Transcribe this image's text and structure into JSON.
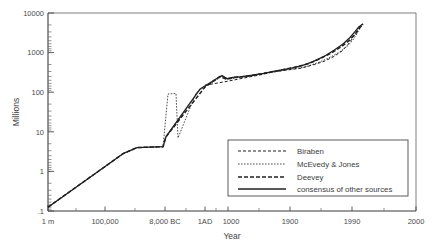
{
  "chart_data": {
    "type": "line",
    "title": "",
    "subtitle": "",
    "xlabel": "Year",
    "ylabel": "Millions",
    "yscale": "log",
    "ylim": [
      0.1,
      10000
    ],
    "grid": false,
    "legend_position": "bottom-right",
    "y_tick_labels": [
      "10000",
      "1000",
      "100",
      "10",
      "1",
      ".1"
    ],
    "y_tick_values": [
      10000,
      1000,
      100,
      10,
      1,
      0.1
    ],
    "x_tick_labels": [
      "1 m",
      "100,000",
      "8,000 BC",
      "1AD",
      "1000",
      "1900",
      "1990",
      "2000"
    ],
    "x_axis_note": "non-linear compressed time axis: 1 million years ago to 2000 AD",
    "series": [
      {
        "name": "Biraben",
        "style": "fine-dashed",
        "points": [
          [
            205,
            150
          ],
          [
            228,
            190
          ],
          [
            252,
            250
          ],
          [
            262,
            280
          ],
          [
            272,
            320
          ],
          [
            286,
            360
          ],
          [
            300,
            400
          ],
          [
            312,
            480
          ],
          [
            324,
            600
          ],
          [
            334,
            800
          ],
          [
            342,
            1100
          ],
          [
            348,
            1600
          ],
          [
            352,
            2200
          ],
          [
            356,
            3200
          ],
          [
            359,
            4400
          ],
          [
            362,
            5300
          ]
        ]
      },
      {
        "name": "McEvedy & Jones",
        "style": "dotted",
        "points": [
          [
            48,
            0.125
          ],
          [
            123,
            2.8
          ],
          [
            137,
            4.0
          ],
          [
            163,
            4.2
          ],
          [
            168,
            90
          ],
          [
            176,
            93
          ],
          [
            178,
            7.0
          ],
          [
            196,
            95
          ],
          [
            205,
            140
          ],
          [
            216,
            200
          ],
          [
            222,
            255
          ],
          [
            228,
            210
          ],
          [
            236,
            230
          ],
          [
            248,
            250
          ],
          [
            262,
            290
          ],
          [
            275,
            330
          ],
          [
            290,
            380
          ],
          [
            305,
            430
          ],
          [
            318,
            560
          ],
          [
            330,
            760
          ],
          [
            340,
            1050
          ],
          [
            348,
            1500
          ],
          [
            353,
            2100
          ],
          [
            357,
            3000
          ],
          [
            360,
            4200
          ],
          [
            363,
            5300
          ]
        ]
      },
      {
        "name": "Deevey",
        "style": "thick-dashed",
        "points": [
          [
            48,
            0.125
          ],
          [
            123,
            2.8
          ],
          [
            137,
            4.0
          ],
          [
            163,
            4.2
          ],
          [
            166,
            7.5
          ],
          [
            205,
            135
          ],
          [
            214,
            195
          ],
          [
            220,
            250
          ],
          [
            226,
            215
          ],
          [
            234,
            235
          ],
          [
            248,
            255
          ],
          [
            262,
            295
          ],
          [
            278,
            350
          ],
          [
            294,
            420
          ],
          [
            308,
            520
          ],
          [
            320,
            700
          ],
          [
            332,
            1000
          ],
          [
            342,
            1450
          ],
          [
            350,
            2100
          ],
          [
            356,
            3100
          ],
          [
            360,
            4300
          ],
          [
            363,
            5300
          ]
        ]
      },
      {
        "name": "consensus of other sources",
        "style": "solid",
        "points": [
          [
            48,
            0.125
          ],
          [
            123,
            2.8
          ],
          [
            137,
            4.0
          ],
          [
            163,
            4.2
          ],
          [
            166,
            7.5
          ],
          [
            200,
            120
          ],
          [
            208,
            160
          ],
          [
            216,
            215
          ],
          [
            222,
            262
          ],
          [
            227,
            220
          ],
          [
            233,
            238
          ],
          [
            242,
            248
          ],
          [
            252,
            268
          ],
          [
            264,
            300
          ],
          [
            276,
            345
          ],
          [
            290,
            400
          ],
          [
            302,
            470
          ],
          [
            313,
            590
          ],
          [
            324,
            800
          ],
          [
            334,
            1150
          ],
          [
            343,
            1650
          ],
          [
            350,
            2400
          ],
          [
            355,
            3400
          ],
          [
            359,
            4500
          ],
          [
            363,
            5300
          ]
        ]
      }
    ],
    "legend_entries": [
      {
        "label": "Biraben",
        "style": "fine-dashed"
      },
      {
        "label": "McEvedy & Jones",
        "style": "dotted"
      },
      {
        "label": "Deevey",
        "style": "thick-dashed"
      },
      {
        "label": "consensus of other sources",
        "style": "solid"
      }
    ]
  },
  "axes": {
    "y_title": "Millions",
    "x_title": "Year",
    "y_ticks": [
      {
        "label": "10000",
        "y": 13
      },
      {
        "label": "1000",
        "y": 52.6
      },
      {
        "label": "100",
        "y": 92.2
      },
      {
        "label": "10",
        "y": 131.8
      },
      {
        "label": "1",
        "y": 171.4
      },
      {
        "label": ".1",
        "y": 211
      }
    ],
    "x_ticks": [
      {
        "label": "1 m",
        "x": 48
      },
      {
        "label": "100,000",
        "x": 105
      },
      {
        "label": "8,000 BC",
        "x": 165
      },
      {
        "label": "1AD",
        "x": 205
      },
      {
        "label": "1000",
        "x": 228
      },
      {
        "label": "1900",
        "x": 290
      },
      {
        "label": "1990",
        "x": 352
      },
      {
        "label": "2000",
        "x": 416
      }
    ]
  },
  "legend": {
    "entries": [
      {
        "label": "Biraben"
      },
      {
        "label": "McEvedy & Jones"
      },
      {
        "label": "Deevey"
      },
      {
        "label": "consensus of other sources"
      }
    ]
  },
  "colors": {
    "ink": "#202020",
    "axis": "#4a4a4a",
    "frame": "#6f6f6f",
    "background": "#ffffff"
  }
}
